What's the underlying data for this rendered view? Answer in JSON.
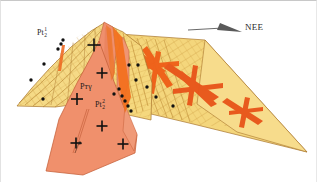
{
  "figure": {
    "background_color": "#ffffff",
    "width": 317,
    "height": 182
  },
  "legend": {
    "direction_label": "NEE",
    "arrow_name": "direction-arrow",
    "arrow_color": "#4a4a4a"
  },
  "labels": [
    {
      "id": "unit-pt2-1",
      "base": "Pt",
      "sub": "2",
      "sup": "1",
      "x": 38,
      "y": 28
    },
    {
      "id": "unit-pt2-gamma",
      "base": "P",
      "sub": "t",
      "sup": "γ",
      "x": 81,
      "y": 84,
      "text": "Pтγ"
    },
    {
      "id": "unit-pt2-2",
      "base": "Pt",
      "sub": "2",
      "sup": "2",
      "x": 95,
      "y": 100
    }
  ],
  "units": {
    "sedimentary_yellow": {
      "name": "layered-yellow-unit",
      "color": "#f3d478"
    },
    "sedimentary_yellow_light": {
      "name": "layered-yellow-light",
      "color": "#f7e0a0"
    },
    "granite_salmon": {
      "name": "granite-intrusion",
      "color": "#f0906c"
    },
    "granite_salmon_dark": {
      "name": "granite-intrusion-dark",
      "color": "#e8805c"
    },
    "vein_orange": {
      "name": "orange-vein",
      "color": "#f26a1b"
    },
    "vein_red": {
      "name": "red-vein",
      "color": "#e4521a"
    },
    "outline": {
      "name": "unit-outline",
      "color": "#9a6a2a"
    },
    "hatch": {
      "name": "bedding-hatch",
      "color": "#c9912f"
    },
    "dot": {
      "name": "sample-dot",
      "color": "#111111"
    },
    "cross": {
      "name": "granite-cross-symbol",
      "color": "#111111"
    }
  },
  "crosses": [
    {
      "x": 93,
      "y": 44,
      "size": 13
    },
    {
      "x": 101,
      "y": 72,
      "size": 11
    },
    {
      "x": 76,
      "y": 98,
      "size": 12
    },
    {
      "x": 101,
      "y": 125,
      "size": 11
    },
    {
      "x": 75,
      "y": 142,
      "size": 11
    },
    {
      "x": 122,
      "y": 143,
      "size": 11
    }
  ],
  "dots": [
    {
      "x": 62,
      "y": 39
    },
    {
      "x": 57,
      "y": 48
    },
    {
      "x": 43,
      "y": 63
    },
    {
      "x": 30,
      "y": 79
    },
    {
      "x": 42,
      "y": 98
    },
    {
      "x": 60,
      "y": 43
    },
    {
      "x": 128,
      "y": 64
    },
    {
      "x": 135,
      "y": 79
    },
    {
      "x": 146,
      "y": 86
    },
    {
      "x": 155,
      "y": 96
    },
    {
      "x": 172,
      "y": 105
    },
    {
      "x": 137,
      "y": 64
    },
    {
      "x": 118,
      "y": 88
    },
    {
      "x": 121,
      "y": 95
    },
    {
      "x": 124,
      "y": 100
    },
    {
      "x": 127,
      "y": 105
    },
    {
      "x": 130,
      "y": 110
    },
    {
      "x": 113,
      "y": 93
    }
  ]
}
